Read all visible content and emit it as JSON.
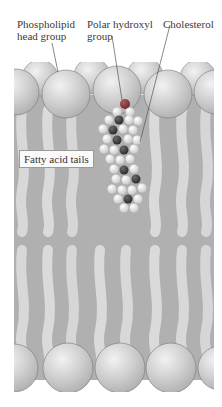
{
  "labels": {
    "head_group": [
      "Phospholipid",
      "head group"
    ],
    "hydroxyl": [
      "Polar hydroxyl",
      "group"
    ],
    "cholesterol": "Cholesterol",
    "tails": "Fatty acid tails"
  },
  "colors": {
    "background": "#ffffff",
    "membrane_fill": "#b4b4b4",
    "head_sphere": "#d4d4d4",
    "tail_light": "#dadada",
    "tail_dark": "#a8a8a8",
    "hydroxyl_oxygen": "#8a3a3a",
    "carbon_dark": "#3c3c3c",
    "hydrogen_white": "#f4f4f4"
  }
}
